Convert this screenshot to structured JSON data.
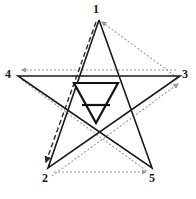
{
  "figure": {
    "background_color": "#ffffff",
    "width": 196,
    "height": 199
  },
  "style": {
    "star_stroke_color": "#1a1a1a",
    "star_stroke_width": 1.6,
    "dashed_path_color": "#2b2b2b",
    "dashed_path_width": 1.4,
    "dashed_pattern": "5,3",
    "dotted_path_color": "#9a9a9a",
    "dotted_path_width": 1.2,
    "dotted_pattern": "2,2",
    "center_symbol_color": "#111111",
    "center_symbol_width": 2.2,
    "label_color": "#1a1a1a"
  },
  "vertices": [
    {
      "id": "1",
      "label": "1",
      "role": "top-apex",
      "x": 99,
      "y": 20,
      "label_x": 93,
      "label_y": 3
    },
    {
      "id": "2",
      "label": "2",
      "role": "bottom-left-point",
      "x": 48,
      "y": 168,
      "label_x": 42,
      "label_y": 172
    },
    {
      "id": "3",
      "label": "3",
      "role": "right-point",
      "x": 180,
      "y": 76,
      "label_x": 182,
      "label_y": 68
    },
    {
      "id": "4",
      "label": "4",
      "role": "left-point",
      "x": 18,
      "y": 76,
      "label_x": 5,
      "label_y": 68
    },
    {
      "id": "5",
      "label": "5",
      "role": "bottom-right-point",
      "x": 152,
      "y": 168,
      "label_x": 149,
      "label_y": 172
    }
  ],
  "star_outline": {
    "name": "pentagram-solid-outline",
    "order": [
      "1",
      "2",
      "3",
      "4",
      "5",
      "1"
    ],
    "points": "99,20 48,168 180,76 18,76 152,168 99,20",
    "closed": true,
    "line_style": "solid"
  },
  "stroke_paths": [
    {
      "id": "stroke-1-2",
      "name": "dashed-stroke-1-to-2",
      "from": "1",
      "to": "2",
      "line_style": "dashed",
      "arrow_at": "2",
      "arrow_direction": "down-left",
      "d": "M 96,22 L 46,162"
    },
    {
      "id": "stroke-1-3",
      "name": "dotted-stroke-1-to-3",
      "from": "1",
      "to": "3",
      "line_style": "dotted",
      "arrow_at": "1",
      "arrow_direction": "down-right",
      "d": "M 102,22 L 178,78"
    },
    {
      "id": "stroke-3-4",
      "name": "dotted-stroke-3-to-4",
      "from": "3",
      "to": "4",
      "line_style": "dotted",
      "arrow_at": "4",
      "arrow_direction": "left",
      "d": "M 176,70 L 22,70"
    },
    {
      "id": "stroke-4-5",
      "name": "dotted-stroke-4-to-5",
      "from": "4",
      "to": "5",
      "line_style": "dotted",
      "arrow_at": "5",
      "arrow_direction": "down-right",
      "d": "M 22,80 L 148,172"
    },
    {
      "id": "stroke-2-5",
      "name": "dotted-stroke-2-to-5",
      "from": "2",
      "to": "5",
      "line_style": "dotted",
      "arrow_at": "5",
      "arrow_direction": "right",
      "d": "M 54,172 L 146,172"
    },
    {
      "id": "stroke-5-3",
      "name": "dotted-stroke-5-to-3",
      "from": "5",
      "to": "3",
      "line_style": "dotted",
      "arrow_at": "3",
      "arrow_direction": "up-right",
      "d": "M 52,176 L 178,84"
    }
  ],
  "center_symbol": {
    "name": "inverted-triangle-with-bar",
    "meaning": "alchemical earth symbol",
    "triangle_points": "74,83 118,83 96,123",
    "bar": {
      "x1": 82,
      "y1": 105,
      "x2": 110,
      "y2": 105
    }
  }
}
